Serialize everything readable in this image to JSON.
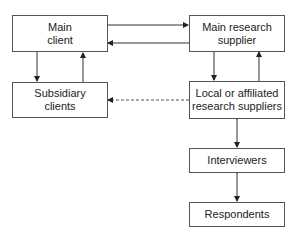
{
  "diagram": {
    "nodes": [
      {
        "id": "main_client",
        "label": "Main\nclient"
      },
      {
        "id": "main_research_supplier",
        "label": "Main research\nsupplier"
      },
      {
        "id": "subsidiary_clients",
        "label": "Subsidiary\nclients"
      },
      {
        "id": "local_suppliers",
        "label": "Local or affiliated\nresearch suppliers"
      },
      {
        "id": "interviewers",
        "label": "Interviewers"
      },
      {
        "id": "respondents",
        "label": "Respondents"
      }
    ],
    "edges": [
      {
        "from": "main_client",
        "to": "main_research_supplier",
        "style": "solid"
      },
      {
        "from": "main_research_supplier",
        "to": "main_client",
        "style": "solid"
      },
      {
        "from": "main_client",
        "to": "subsidiary_clients",
        "style": "solid"
      },
      {
        "from": "subsidiary_clients",
        "to": "main_client",
        "style": "solid"
      },
      {
        "from": "main_research_supplier",
        "to": "local_suppliers",
        "style": "solid"
      },
      {
        "from": "local_suppliers",
        "to": "main_research_supplier",
        "style": "solid"
      },
      {
        "from": "local_suppliers",
        "to": "subsidiary_clients",
        "style": "dashed"
      },
      {
        "from": "local_suppliers",
        "to": "interviewers",
        "style": "solid",
        "bidirectional": true
      },
      {
        "from": "interviewers",
        "to": "respondents",
        "style": "solid",
        "bidirectional": true
      }
    ]
  },
  "labels": {
    "main_client": "Main client",
    "main_research_supplier": "Main research supplier",
    "subsidiary_clients": "Subsidiary clients",
    "local_suppliers": "Local or affiliated research suppliers",
    "interviewers": "Interviewers",
    "respondents": "Respondents"
  }
}
